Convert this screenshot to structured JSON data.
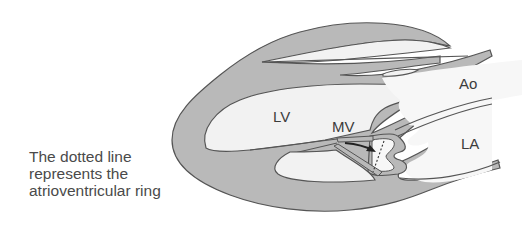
{
  "caption": {
    "lines": [
      "The dotted line",
      "represents the",
      "atrioventricular ring"
    ]
  },
  "labels": {
    "lv": "LV",
    "mv": "MV",
    "ao": "Ao",
    "la": "LA"
  },
  "colors": {
    "wall": "#b9b9b9",
    "chamber": "#f2f2f2",
    "outline": "#555555",
    "text": "#4a4a4a"
  }
}
